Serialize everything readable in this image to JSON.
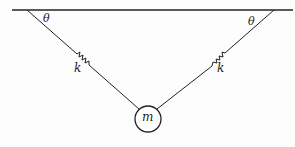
{
  "diagram": {
    "labels": {
      "theta_left": "θ",
      "theta_right": "θ",
      "spring_left": "k",
      "spring_right": "k",
      "mass": "m"
    },
    "colors": {
      "line": "#222222",
      "background": "#fdfdfd"
    }
  }
}
